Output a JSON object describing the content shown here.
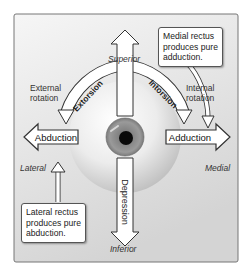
{
  "diagram": {
    "directions": {
      "superior": "Superior",
      "inferior": "Inferior",
      "lateral": "Lateral",
      "medial": "Medial"
    },
    "rotations": {
      "external": [
        "External",
        "rotation"
      ],
      "internal": [
        "Internal",
        "rotation"
      ]
    },
    "arrows": {
      "elevation": "Elevation",
      "depression": "Depression",
      "abduction": "Abduction",
      "adduction": "Adduction",
      "extorsion": "Extorsion",
      "intorsion": "Intorsion"
    },
    "callouts": {
      "medial_rectus": [
        "Medial rectus",
        "produces pure",
        "adduction."
      ],
      "lateral_rectus": [
        "Lateral rectus",
        "produces pure",
        "abduction."
      ]
    },
    "colors": {
      "panel_top": "#f2f2f2",
      "panel_bottom": "#d8d8d8",
      "iris": "#8a8a8a",
      "pupil": "#0a0a0a",
      "arrow_fill": "#ffffff",
      "arrow_stroke": "#333333"
    }
  }
}
